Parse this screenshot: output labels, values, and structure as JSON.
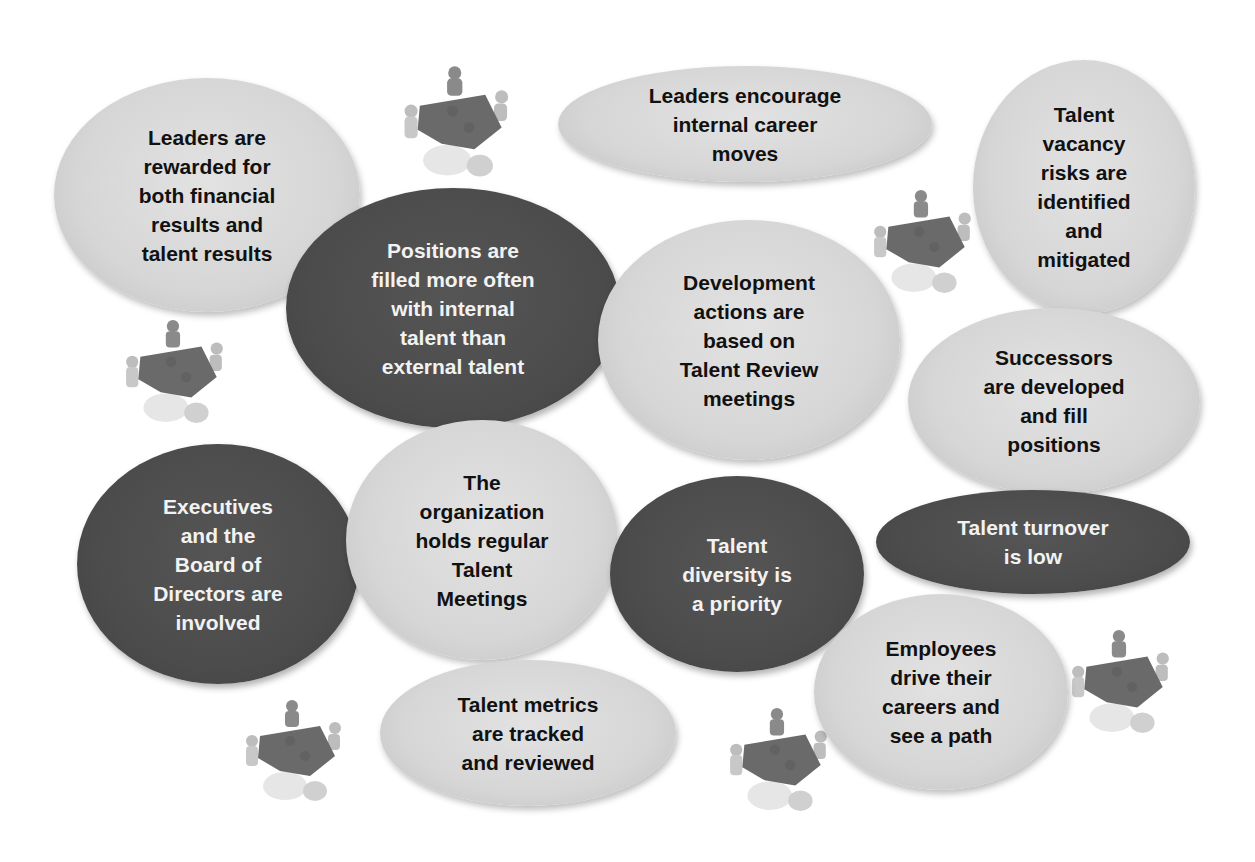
{
  "colors": {
    "light_bubble": "#d8d8d8",
    "dark_bubble": "#4d4d4d",
    "light_text": "#111111",
    "dark_text": "#f2f2f2",
    "background": "#ffffff"
  },
  "bubbles": [
    {
      "id": "leaders-rewarded",
      "tone": "light",
      "text": "Leaders are\nrewarded for\nboth financial\nresults and\ntalent results"
    },
    {
      "id": "leaders-encourage",
      "tone": "light",
      "text": "Leaders encourage\ninternal career\nmoves"
    },
    {
      "id": "vacancy-risks",
      "tone": "light",
      "text": "Talent\nvacancy\nrisks are\nidentified\nand\nmitigated"
    },
    {
      "id": "positions-filled",
      "tone": "dark",
      "text": "Positions are\nfilled more often\nwith internal\ntalent than\nexternal talent"
    },
    {
      "id": "development-actions",
      "tone": "light",
      "text": "Development\nactions are\nbased on\nTalent Review\nmeetings"
    },
    {
      "id": "successors",
      "tone": "light",
      "text": "Successors\nare developed\nand fill\npositions"
    },
    {
      "id": "executives-board",
      "tone": "dark",
      "text": "Executives\nand the\nBoard of\nDirectors are\ninvolved"
    },
    {
      "id": "regular-meetings",
      "tone": "light",
      "text": "The\norganization\nholds regular\nTalent\nMeetings"
    },
    {
      "id": "diversity",
      "tone": "dark",
      "text": "Talent\ndiversity is\na priority"
    },
    {
      "id": "turnover",
      "tone": "dark",
      "text": "Talent turnover\nis low"
    },
    {
      "id": "employees-drive",
      "tone": "light",
      "text": "Employees\ndrive their\ncareers and\nsee a path"
    },
    {
      "id": "metrics",
      "tone": "light",
      "text": "Talent metrics\nare tracked\nand reviewed"
    }
  ],
  "icons": [
    {
      "name": "team-puzzle-icon",
      "count": 6
    }
  ]
}
